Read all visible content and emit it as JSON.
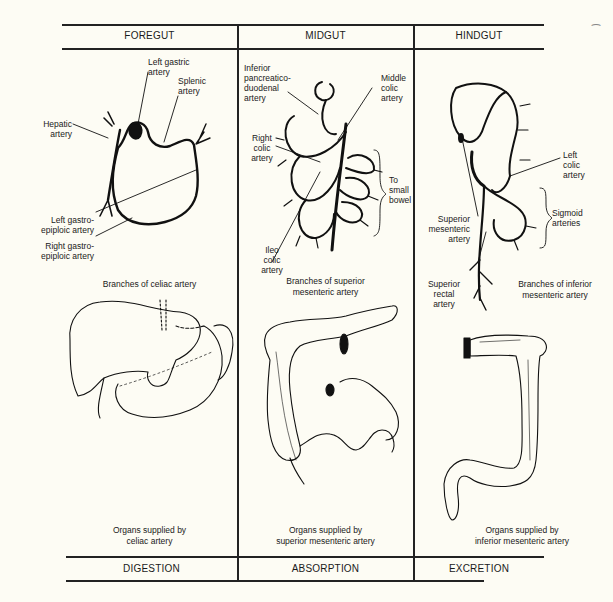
{
  "columns": [
    {
      "header": "FOREGUT",
      "arteries": {
        "left_gastric": "Left gastric\nartery",
        "splenic": "Splenic\nartery",
        "hepatic": "Hepatic\nartery",
        "left_gastroepiploic": "Left gastro-\nepiploic artery",
        "right_gastroepiploic": "Right gastro-\nepiploic artery"
      },
      "branches_caption": "Branches of celiac artery",
      "organs_caption": [
        "Organs supplied by",
        "celiac artery"
      ],
      "function": "DIGESTION"
    },
    {
      "header": "MIDGUT",
      "arteries": {
        "inferior_pancreaticoduodenal": "Inferior\npancreatico-\nduodenal\nartery",
        "middle_colic": "Middle\ncolic\nartery",
        "right_colic": "Right\ncolic\nartery",
        "to_small_bowel": "To\nsmall\nbowel",
        "ileocolic": "Ileo\ncolic\nartery"
      },
      "branches_caption": [
        "Branches of superior",
        "mesenteric artery"
      ],
      "organs_caption": [
        "Organs supplied by",
        "superior mesenteric artery"
      ],
      "function": "ABSORPTION"
    },
    {
      "header": "HINDGUT",
      "arteries": {
        "left_colic": "Left\ncolic\nartery",
        "superior_mesenteric": "Superior\nmesenteric\nartery",
        "sigmoid": "Sigmoid\narteries",
        "superior_rectal": "Superior\nrectal\nartery"
      },
      "branches_caption": [
        "Branches of inferior",
        "mesenteric artery"
      ],
      "organs_caption": [
        "Organs supplied by",
        "inferior mesenteric artery"
      ],
      "function": "EXCRETION"
    }
  ]
}
